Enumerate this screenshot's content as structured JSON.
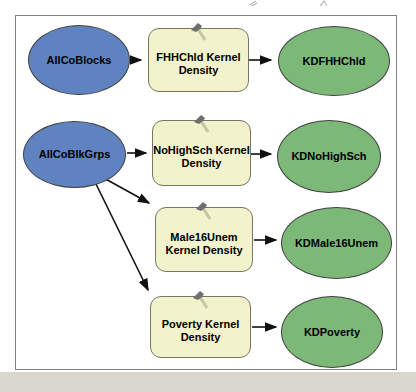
{
  "diagram": {
    "app": "ModelBuilder kernel-density model diagram",
    "nodes": {
      "allCoBlocks": {
        "label": "AllCoBlocks",
        "type": "input-data"
      },
      "fhhchldTool": {
        "label": "FHHChld Kernel Density",
        "lines": [
          "FHHChld Kernel",
          "Density"
        ],
        "type": "tool",
        "icon": "hammer-icon"
      },
      "kdFhhChld": {
        "label": "KDFHHChld",
        "type": "derived-data"
      },
      "allCoBlkGrps": {
        "label": "AllCoBlkGrps",
        "type": "input-data"
      },
      "noHighSchTool": {
        "label": "NoHighSch Kernel Density",
        "lines": [
          "NoHighSch Kernel",
          "Density"
        ],
        "type": "tool",
        "icon": "hammer-icon"
      },
      "kdNoHighSch": {
        "label": "KDNoHighSch",
        "type": "derived-data"
      },
      "male16UnemTool": {
        "label": "Male16Unem Kernel Density",
        "lines": [
          "Male16Unem",
          "Kernel Density"
        ],
        "type": "tool",
        "icon": "hammer-icon"
      },
      "kdMale16Unem": {
        "label": "KDMale16Unem",
        "type": "derived-data"
      },
      "povertyTool": {
        "label": "Poverty Kernel Density",
        "lines": [
          "Poverty Kernel",
          "Density"
        ],
        "type": "tool",
        "icon": "hammer-icon"
      },
      "kdPoverty": {
        "label": "KDPoverty",
        "type": "derived-data"
      }
    },
    "edges": [
      {
        "from": "AllCoBlocks",
        "to": "FHHChld Kernel Density"
      },
      {
        "from": "FHHChld Kernel Density",
        "to": "KDFHHChld"
      },
      {
        "from": "AllCoBlkGrps",
        "to": "NoHighSch Kernel Density"
      },
      {
        "from": "NoHighSch Kernel Density",
        "to": "KDNoHighSch"
      },
      {
        "from": "AllCoBlkGrps",
        "to": "Male16Unem Kernel Density"
      },
      {
        "from": "Male16Unem Kernel Density",
        "to": "KDMale16Unem"
      },
      {
        "from": "AllCoBlkGrps",
        "to": "Poverty Kernel Density"
      },
      {
        "from": "Poverty Kernel Density",
        "to": "KDPoverty"
      }
    ],
    "colors": {
      "input_data_fill": "#5f83c0",
      "tool_fill": "#f2f2cc",
      "derived_data_fill": "#7cb878",
      "node_border": "#404040",
      "tool_border": "#77775e",
      "arrow": "#111111",
      "canvas_border": "#818181",
      "canvas_bg": "#ffffff",
      "page_bottom_strip": "#dad7cf"
    }
  }
}
